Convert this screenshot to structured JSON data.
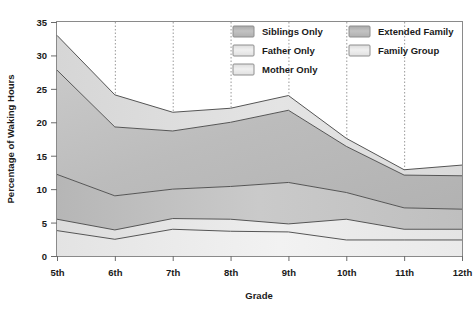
{
  "chart_data": {
    "type": "area",
    "title": "",
    "subtitle": "",
    "xlabel": "Grade",
    "ylabel": "Percentage of Waking Hours",
    "categories": [
      "5th",
      "6th",
      "7th",
      "8th",
      "9th",
      "10th",
      "11th",
      "12th"
    ],
    "ylim": [
      0,
      35
    ],
    "yticks": [
      0,
      5,
      10,
      15,
      20,
      25,
      30,
      35
    ],
    "ytick_labels": [
      "0",
      "5",
      "10",
      "15",
      "20",
      "25",
      "30",
      "35"
    ],
    "grid": "vertical-dotted",
    "stacked": true,
    "legend_position": "top-right-inside",
    "series": [
      {
        "name": "Mother Only",
        "color": "#ededed",
        "values": [
          3.8,
          2.5,
          4.0,
          3.7,
          3.6,
          2.4,
          2.4,
          2.4
        ]
      },
      {
        "name": "Father Only",
        "color": "#e2e2e2",
        "values": [
          1.7,
          1.4,
          1.6,
          1.8,
          1.2,
          3.1,
          1.6,
          1.6
        ]
      },
      {
        "name": "Siblings Only",
        "color": "#c6c6c6",
        "values": [
          6.7,
          5.1,
          4.4,
          4.9,
          6.2,
          4.0,
          3.2,
          3.0
        ]
      },
      {
        "name": "Extended Family",
        "color": "#bdbdbd",
        "values": [
          15.6,
          10.3,
          8.7,
          9.6,
          10.8,
          6.9,
          4.9,
          5.0
        ]
      },
      {
        "name": "Family Group",
        "color": "#dcdcdc",
        "values": [
          5.2,
          4.8,
          2.8,
          2.1,
          2.2,
          1.2,
          0.8,
          1.6
        ]
      }
    ],
    "cumulative_tops": {
      "Mother Only": [
        3.8,
        2.5,
        4.0,
        3.7,
        3.6,
        2.4,
        2.4,
        2.4
      ],
      "Father Only": [
        5.5,
        3.9,
        5.6,
        5.5,
        4.8,
        5.5,
        4.0,
        4.0
      ],
      "Siblings Only": [
        12.2,
        9.0,
        10.0,
        10.4,
        11.0,
        9.5,
        7.2,
        7.0
      ],
      "Extended Family": [
        27.8,
        19.3,
        18.7,
        20.0,
        21.8,
        16.4,
        12.1,
        12.0
      ],
      "Family Group": [
        33.0,
        24.1,
        21.5,
        22.1,
        24.0,
        17.6,
        12.9,
        13.6
      ]
    }
  },
  "legend": {
    "items": [
      {
        "label": "Siblings Only",
        "swatch": "#c6c6c6"
      },
      {
        "label": "Extended Family",
        "swatch": "#b4b4b4"
      },
      {
        "label": "Father Only",
        "swatch": "#e2e2e2"
      },
      {
        "label": "Family Group",
        "swatch": "#d4d4d4"
      },
      {
        "label": "Mother Only",
        "swatch": "#ededed"
      }
    ]
  },
  "axes": {
    "x_title": "Grade",
    "y_title": "Percentage of Waking Hours",
    "x_labels": [
      "5th",
      "6th",
      "7th",
      "8th",
      "9th",
      "10th",
      "11th",
      "12th"
    ],
    "y_labels": [
      "0",
      "5",
      "10",
      "15",
      "20",
      "25",
      "30",
      "35"
    ]
  },
  "colors": {
    "plot_border": "#8a8a8a",
    "series_line": "#555555",
    "grid_line": "#999999",
    "text": "#1a1a1a",
    "background": "#ffffff"
  }
}
